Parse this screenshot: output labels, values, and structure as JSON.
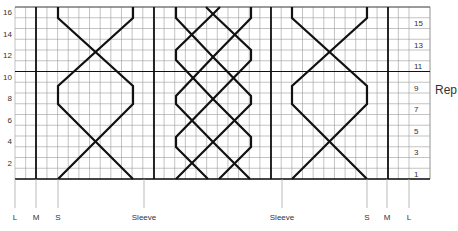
{
  "diagram": {
    "type": "knitting-chart",
    "grid": {
      "left": 15,
      "right": 409,
      "top": 7,
      "bottom": 179,
      "columns": 37,
      "rows": 16,
      "thick_col_x": [
        36,
        154,
        271,
        388
      ],
      "thick_row_after": 10,
      "number_col_right": 430,
      "grid_color": "#9a9a9a",
      "thick_color": "#111111"
    },
    "left_row_labels": [
      {
        "row": 2,
        "text": "2"
      },
      {
        "row": 4,
        "text": "4"
      },
      {
        "row": 6,
        "text": "6"
      },
      {
        "row": 8,
        "text": "8"
      },
      {
        "row": 10,
        "text": "10"
      },
      {
        "row": 12,
        "text": "12"
      },
      {
        "row": 14,
        "text": "14"
      },
      {
        "row": 16,
        "text": "16"
      }
    ],
    "right_row_labels": [
      {
        "row": 1,
        "text": "1"
      },
      {
        "row": 3,
        "text": "3"
      },
      {
        "row": 5,
        "text": "5"
      },
      {
        "row": 7,
        "text": "7"
      },
      {
        "row": 9,
        "text": "9"
      },
      {
        "row": 11,
        "text": "11"
      },
      {
        "row": 13,
        "text": "13"
      },
      {
        "row": 15,
        "text": "15"
      }
    ],
    "rep_label": "Rep",
    "size_markers": [
      {
        "x": 15,
        "text": "L"
      },
      {
        "x": 36,
        "text": "M"
      },
      {
        "x": 58,
        "text": "S"
      },
      {
        "x": 144,
        "text": "Sleeve"
      },
      {
        "x": 282,
        "text": "Sleeve"
      },
      {
        "x": 367,
        "text": "S"
      },
      {
        "x": 387,
        "text": "M"
      },
      {
        "x": 409,
        "text": "L"
      }
    ],
    "cables": [
      {
        "name": "left-cable",
        "paths": [
          "M58,179 L133,104 L133,86 L58,18 L58,7",
          "M133,179 L58,104 L58,86 L133,18 L133,7"
        ]
      },
      {
        "name": "right-cable",
        "paths": [
          "M292,179 L367,104 L367,86 L292,18 L292,7",
          "M367,179 L292,104 L292,86 L367,18 L367,7"
        ]
      },
      {
        "name": "center-braid",
        "paths": [
          "M176,179 L213,142 L251,104 L251,96 L213,57 L176,18 L176,7",
          "M208,179 L176,147 L176,137 L213,99 L251,60 L251,50 L213,14 L206,7",
          "M219,179 L251,147 L251,137 L213,99 L176,60 L176,50 L213,14 L220,7",
          "M250,179 L213,142 L176,104 L176,96 L213,57 L251,18 L251,7"
        ]
      }
    ]
  }
}
